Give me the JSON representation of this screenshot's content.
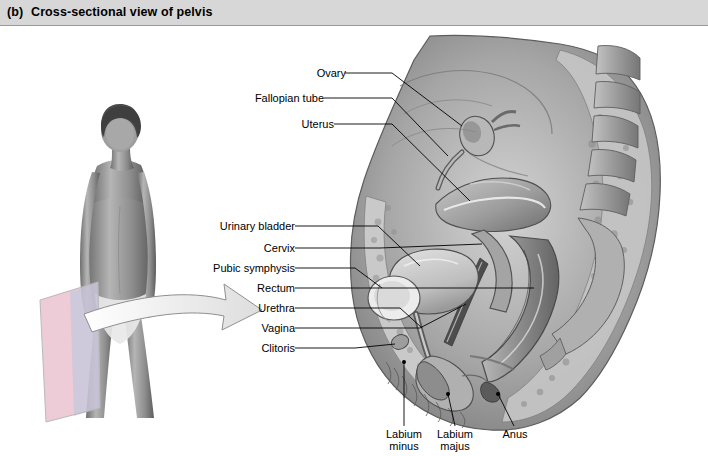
{
  "header": {
    "panel_label": "(b)",
    "title": "Cross-sectional view of pelvis",
    "bar_color": "#d7d7d7"
  },
  "figure": {
    "type": "anatomical-illustration",
    "photo_caption": "standing female figure with sagittal section plane indicated",
    "arrow_note": "arrow pointing from body section plane to cross-sectional drawing"
  },
  "labels": {
    "left_upper": [
      {
        "id": "ovary",
        "text": "Ovary"
      },
      {
        "id": "fallopian-tube",
        "text": "Fallopian tube"
      },
      {
        "id": "uterus",
        "text": "Uterus"
      }
    ],
    "left_lower": [
      {
        "id": "urinary-bladder",
        "text": "Urinary bladder"
      },
      {
        "id": "cervix",
        "text": "Cervix"
      },
      {
        "id": "pubic-symphysis",
        "text": "Pubic symphysis"
      },
      {
        "id": "rectum",
        "text": "Rectum"
      },
      {
        "id": "urethra",
        "text": "Urethra"
      },
      {
        "id": "vagina",
        "text": "Vagina"
      },
      {
        "id": "clitoris",
        "text": "Clitoris"
      }
    ],
    "bottom": [
      {
        "id": "labium-minus",
        "line1": "Labium",
        "line2": "minus"
      },
      {
        "id": "labium-majus",
        "line1": "Labium",
        "line2": "majus"
      },
      {
        "id": "anus",
        "line1": "Anus",
        "line2": ""
      }
    ]
  },
  "colors": {
    "line": "#000000",
    "tissue_mid": "#9a9a9a",
    "tissue_dark": "#6a6a6a",
    "tissue_light": "#d0d0d0",
    "section_plane_pink": "#e7b9c8",
    "section_plane_blue": "#b9c6dd"
  }
}
